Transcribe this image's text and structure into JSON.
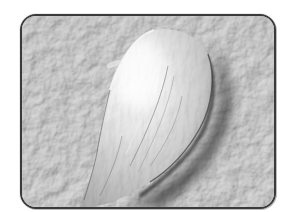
{
  "image": {
    "subject": "scanning electron micrograph of a single teardrop-shaped cell on a textured surface",
    "style": "grayscale",
    "frame": {
      "shape": "rounded-rectangle",
      "border_color": "#3a3a3a"
    },
    "colors": {
      "page_background": "#ffffff",
      "surface": "#b9b9b9",
      "surface_dark": "#8f8f8f",
      "cell_highlight": "#f4f4f4",
      "cell_mid": "#c9c9c9",
      "shadow": "#2e2e2e"
    }
  }
}
